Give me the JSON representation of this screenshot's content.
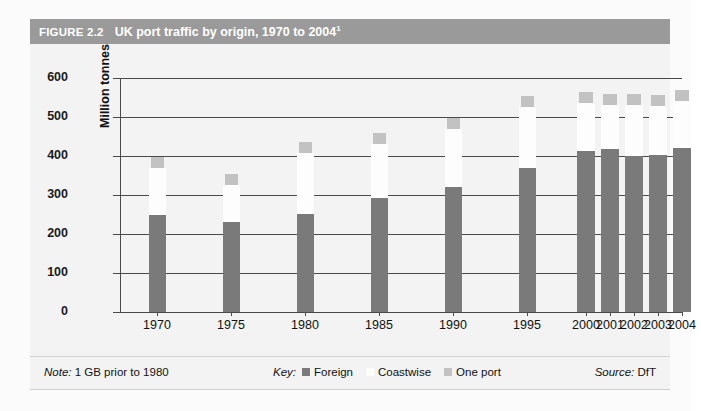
{
  "figure": {
    "number": "FIGURE 2.2",
    "title": "UK port traffic by origin, 1970 to 2004",
    "title_superscript": "1"
  },
  "axis": {
    "y_title": "Million tonnes",
    "y_ticks": [
      "600",
      "500",
      "400",
      "300",
      "200",
      "100",
      "0"
    ],
    "x_labels": [
      "1970",
      "1975",
      "1980",
      "1985",
      "1990",
      "1995",
      "2000",
      "2001",
      "2002",
      "2003",
      "2004"
    ]
  },
  "footer": {
    "note_label": "Note:",
    "note_text": "1 GB prior to 1980",
    "key_label": "Key:",
    "key_items": [
      {
        "label": "Foreign",
        "color": "#7a7a7a"
      },
      {
        "label": "Coastwise",
        "color": "#fdfdfd"
      },
      {
        "label": "One port",
        "color": "#c2c2c2"
      }
    ],
    "source_label": "Source:",
    "source_text": "DfT"
  },
  "chart_data": {
    "type": "bar",
    "stacked": true,
    "title": "UK port traffic by origin, 1970 to 2004",
    "xlabel": "",
    "ylabel": "Million tonnes",
    "ylim": [
      0,
      600
    ],
    "ytick_step": 100,
    "grid": true,
    "legend_position": "bottom",
    "categories": [
      "1970",
      "1975",
      "1980",
      "1985",
      "1990",
      "1995",
      "2000",
      "2001",
      "2002",
      "2003",
      "2004"
    ],
    "series": [
      {
        "name": "Foreign",
        "color": "#7a7a7a",
        "values": [
          250,
          232,
          252,
          292,
          320,
          370,
          412,
          417,
          400,
          403,
          420
        ]
      },
      {
        "name": "Coastwise",
        "color": "#fdfdfd",
        "values": [
          118,
          93,
          155,
          140,
          150,
          155,
          125,
          115,
          130,
          125,
          120
        ]
      },
      {
        "name": "One port",
        "color": "#c2c2c2",
        "values": [
          10,
          10,
          10,
          10,
          10,
          10,
          12,
          12,
          12,
          12,
          12
        ]
      }
    ],
    "totals": [
      378,
      335,
      417,
      442,
      480,
      535,
      549,
      544,
      542,
      540,
      552
    ]
  }
}
